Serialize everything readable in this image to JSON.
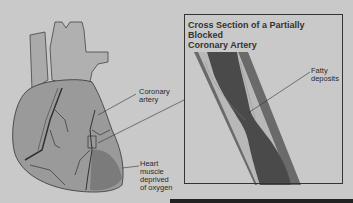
{
  "figure": {
    "title": "Cross Section of a Partially Blocked Coronary Artery",
    "title_line1": "Cross Section of a Partially Blocked",
    "title_line2": "Coronary Artery"
  },
  "labels": {
    "coronary_artery_1": "Coronary",
    "coronary_artery_2": "artery",
    "heart_muscle_1": "Heart",
    "heart_muscle_2": "muscle",
    "heart_muscle_3": "deprived",
    "heart_muscle_4": "of oxygen",
    "fatty_1": "Fatty",
    "fatty_2": "deposits"
  },
  "colors": {
    "background": "#c9c9c9",
    "heart": "#9a9a9a",
    "artery_wall": "#6a6a6a",
    "blood": "#4a4a4a",
    "fat": "#b8b8b8"
  }
}
